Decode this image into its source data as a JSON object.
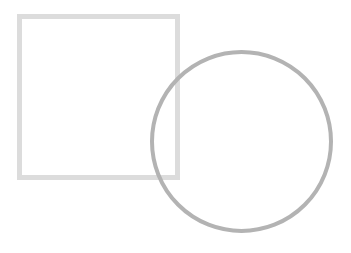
{
  "canvas": {
    "width": 351,
    "height": 253,
    "background": "#ffffff"
  },
  "shapes": {
    "square": {
      "type": "square-outline",
      "x": 19.5,
      "y": 16.5,
      "width": 158,
      "height": 161,
      "stroke": "#dcdcdc",
      "stroke_width": 5
    },
    "circle": {
      "type": "circle-outline",
      "cx": 241.5,
      "cy": 141.5,
      "r": 89.5,
      "stroke": "#b3b3b3",
      "stroke_width": 4
    }
  }
}
